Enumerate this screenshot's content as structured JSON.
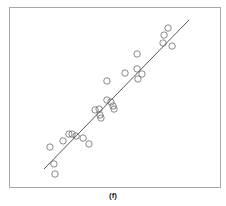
{
  "chart_data": {
    "type": "scatter",
    "title": "",
    "xlabel": "",
    "ylabel": "",
    "caption": "(f)",
    "xlim": [
      0,
      10
    ],
    "ylim": [
      0,
      10
    ],
    "grid": false,
    "legend": null,
    "marker": "open-circle",
    "points": [
      {
        "x": 1.94,
        "y": 2.22
      },
      {
        "x": 2.13,
        "y": 1.28
      },
      {
        "x": 2.18,
        "y": 0.72
      },
      {
        "x": 2.56,
        "y": 2.56
      },
      {
        "x": 2.84,
        "y": 2.94
      },
      {
        "x": 2.99,
        "y": 2.94
      },
      {
        "x": 3.18,
        "y": 2.83
      },
      {
        "x": 3.51,
        "y": 2.72
      },
      {
        "x": 3.79,
        "y": 2.39
      },
      {
        "x": 4.08,
        "y": 4.28
      },
      {
        "x": 4.27,
        "y": 4.33
      },
      {
        "x": 4.36,
        "y": 3.83
      },
      {
        "x": 4.31,
        "y": 4.0
      },
      {
        "x": 4.64,
        "y": 5.89
      },
      {
        "x": 4.64,
        "y": 4.83
      },
      {
        "x": 4.83,
        "y": 4.72
      },
      {
        "x": 4.93,
        "y": 4.5
      },
      {
        "x": 4.98,
        "y": 4.33
      },
      {
        "x": 5.5,
        "y": 6.33
      },
      {
        "x": 6.07,
        "y": 7.39
      },
      {
        "x": 6.07,
        "y": 6.56
      },
      {
        "x": 6.11,
        "y": 6.0
      },
      {
        "x": 6.3,
        "y": 6.28
      },
      {
        "x": 7.3,
        "y": 8.0
      },
      {
        "x": 7.35,
        "y": 8.44
      },
      {
        "x": 7.54,
        "y": 8.83
      },
      {
        "x": 7.73,
        "y": 7.83
      }
    ],
    "fit_line": {
      "x1": 1.66,
      "y1": 1.0,
      "x2": 8.53,
      "y2": 9.28
    },
    "colors": {
      "marker_stroke": "#6b6b6b",
      "line": "#444444",
      "frame": "#a8a8a8",
      "background": "#ffffff"
    }
  },
  "plot_area": {
    "left": 9,
    "top": 7,
    "right": 220,
    "bottom": 187
  }
}
